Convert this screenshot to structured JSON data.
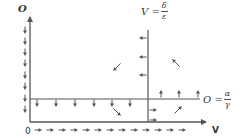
{
  "diagram": {
    "type": "phase-plane",
    "axes": {
      "x_label": "V",
      "y_label": "O",
      "origin_label": "0"
    },
    "nullclines": {
      "vertical": {
        "lhs": "V =",
        "numerator": "δ",
        "denominator": "ε"
      },
      "horizontal": {
        "lhs": "O =",
        "numerator": "α",
        "denominator": "γ"
      }
    },
    "colors": {
      "line": "#555555",
      "text": "#333333",
      "background": "#ffffff"
    },
    "geometry": {
      "origin": [
        30,
        122
      ],
      "x_axis_end": 206,
      "y_axis_top": 17,
      "v_nullcline_x": 148,
      "v_nullcline_top": 30,
      "h_nullcline_y": 99,
      "h_nullcline_end": 200
    },
    "arrow_groups": [
      {
        "name": "y-axis-down-arrows",
        "direction": "down",
        "points": [
          [
            25,
            30
          ],
          [
            25,
            41
          ],
          [
            25,
            52
          ],
          [
            25,
            63
          ],
          [
            25,
            75
          ],
          [
            25,
            86
          ],
          [
            25,
            98
          ],
          [
            25,
            109
          ]
        ]
      },
      {
        "name": "x-axis-right-arrows",
        "direction": "right",
        "points": [
          [
            38,
            130
          ],
          [
            50,
            130
          ],
          [
            62,
            130
          ],
          [
            74,
            130
          ],
          [
            86,
            130
          ],
          [
            98,
            130
          ],
          [
            110,
            130
          ],
          [
            122,
            130
          ],
          [
            134,
            130
          ],
          [
            146,
            130
          ],
          [
            158,
            130
          ],
          [
            170,
            130
          ],
          [
            182,
            130
          ]
        ]
      },
      {
        "name": "h-nullcline-down-arrows",
        "direction": "down",
        "points": [
          [
            37,
            103
          ],
          [
            56,
            103
          ],
          [
            75,
            103
          ],
          [
            94,
            103
          ],
          [
            112,
            103
          ],
          [
            130,
            103
          ]
        ]
      },
      {
        "name": "h-nullcline-up-arrows",
        "direction": "up",
        "points": [
          [
            161,
            94
          ],
          [
            179,
            94
          ],
          [
            198,
            94
          ]
        ]
      },
      {
        "name": "v-nullcline-left-arrows",
        "direction": "left",
        "points": [
          [
            143,
            38
          ],
          [
            143,
            57
          ],
          [
            143,
            75
          ]
        ]
      },
      {
        "name": "v-nullcline-right-arrows",
        "direction": "right",
        "points": [
          [
            153,
            110
          ],
          [
            153,
            120
          ]
        ]
      },
      {
        "name": "region-arrows",
        "direction": "diagonal",
        "points": []
      }
    ],
    "region_arrows": [
      {
        "region": "upper-left",
        "direction": "down-left",
        "at": [
          117,
          67
        ]
      },
      {
        "region": "upper-right",
        "direction": "up-left",
        "at": [
          176,
          63
        ]
      },
      {
        "region": "lower-left",
        "direction": "down-right",
        "at": [
          117,
          112
        ]
      },
      {
        "region": "lower-right",
        "direction": "up-right",
        "at": [
          178,
          110
        ]
      }
    ]
  }
}
